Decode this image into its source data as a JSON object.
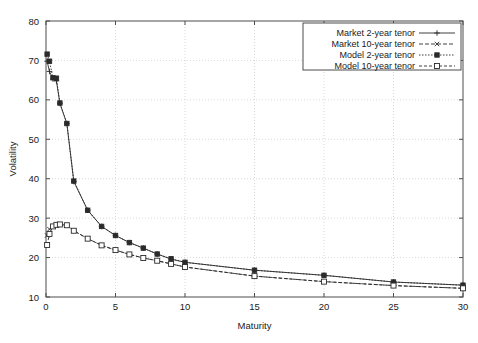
{
  "chart_data": {
    "type": "line",
    "title": "",
    "xlabel": "Maturity",
    "ylabel": "Volatility",
    "xlim": [
      0,
      30
    ],
    "ylim": [
      10,
      80
    ],
    "xticks": [
      0,
      5,
      10,
      15,
      20,
      25,
      30
    ],
    "yticks": [
      10,
      20,
      30,
      40,
      50,
      60,
      70,
      80
    ],
    "xtick_labels": [
      "0",
      "5",
      "10",
      "15",
      "20",
      "25",
      "30"
    ],
    "ytick_labels": [
      "10",
      "20",
      "30",
      "40",
      "50",
      "60",
      "70",
      "80"
    ],
    "grid": true,
    "legend_position": "top-right",
    "series": [
      {
        "name": "Market 2-year tenor",
        "marker": "plus",
        "linestyle": "solid",
        "x": [
          0.08,
          0.25,
          0.5,
          0.75,
          1,
          1.5,
          2,
          3,
          4,
          5,
          6,
          7,
          8,
          9,
          10,
          15,
          20,
          25,
          30
        ],
        "values": [
          69.8,
          67.2,
          65.3,
          64.8,
          59.1,
          54.0,
          39.3,
          32.0,
          27.9,
          25.6,
          23.8,
          22.4,
          20.9,
          19.6,
          18.8,
          16.8,
          15.5,
          13.8,
          13.0
        ]
      },
      {
        "name": "Market 10-year tenor",
        "marker": "x",
        "linestyle": "dashed",
        "x": [
          0.08,
          0.25,
          0.5,
          0.75,
          1,
          1.5,
          2,
          3,
          4,
          5,
          6,
          7,
          8,
          9,
          10,
          15,
          20,
          25,
          30
        ],
        "values": [
          25.6,
          27.2,
          27.9,
          28.3,
          28.4,
          28.2,
          26.8,
          24.8,
          23.1,
          21.9,
          20.8,
          19.9,
          19.2,
          18.4,
          17.6,
          15.3,
          13.9,
          12.9,
          12.2
        ]
      },
      {
        "name": "Model 2-year tenor",
        "marker": "filled-square",
        "linestyle": "dotted",
        "x": [
          0.08,
          0.25,
          0.5,
          0.75,
          1,
          1.5,
          2,
          3,
          4,
          5,
          6,
          7,
          8,
          9,
          10,
          15,
          20,
          25,
          30
        ],
        "values": [
          71.6,
          69.8,
          65.6,
          65.5,
          59.2,
          54.0,
          39.4,
          32.0,
          27.9,
          25.6,
          23.8,
          22.4,
          20.9,
          19.7,
          18.8,
          16.8,
          15.5,
          13.8,
          13.0
        ]
      },
      {
        "name": "Model 10-year tenor",
        "marker": "open-square",
        "linestyle": "dash-dot",
        "x": [
          0.08,
          0.25,
          0.5,
          0.75,
          1,
          1.5,
          2,
          3,
          4,
          5,
          6,
          7,
          8,
          9,
          10,
          15,
          20,
          25,
          30
        ],
        "values": [
          23.2,
          26.0,
          27.9,
          28.3,
          28.4,
          28.2,
          26.8,
          24.8,
          23.1,
          21.9,
          20.8,
          19.9,
          19.2,
          18.4,
          17.6,
          15.3,
          13.9,
          12.9,
          12.2
        ]
      }
    ],
    "legend_entries": [
      "Market 2-year tenor",
      "Market 10-year tenor",
      "Model 2-year tenor",
      "Model 10-year tenor"
    ]
  },
  "colors": {
    "ink": "#2b2b2b",
    "frame": "#4d4d4d",
    "grid": "#c9c9c9",
    "background": "#ffffff"
  }
}
